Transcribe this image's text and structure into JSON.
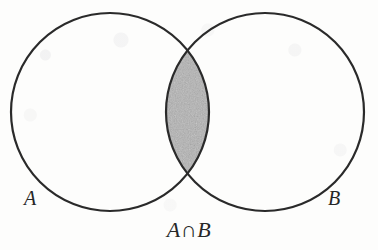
{
  "figure": {
    "kind": "venn-diagram",
    "caption": "A∩B",
    "label_a": "A",
    "label_b": "B",
    "stroke_color": "#2a2a2a",
    "fill_color": "#a9a9a9",
    "background_color": "#fdfdfc",
    "circle_a": {
      "cx": 110,
      "cy": 112,
      "r": 99
    },
    "circle_b": {
      "cx": 265,
      "cy": 112,
      "r": 99
    },
    "stroke_width": 2.2
  }
}
